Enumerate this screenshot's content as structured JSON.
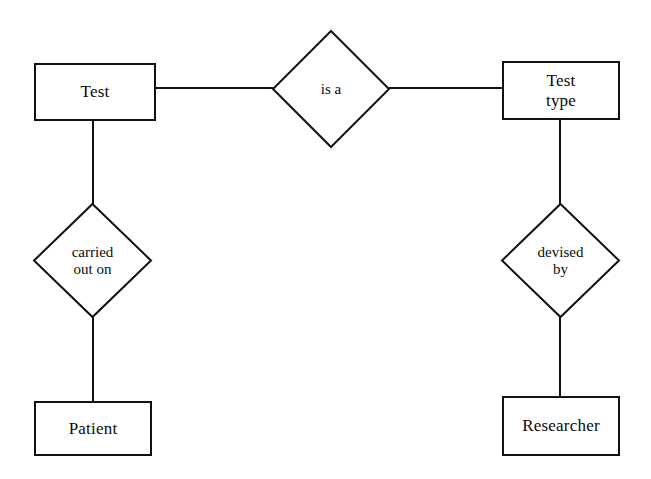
{
  "diagram": {
    "kind": "entity-relationship-diagram",
    "notation": "chen",
    "background_color": "#ffffff",
    "stroke_color": "#111111",
    "text_color": "#0b0b0b",
    "entities": [
      {
        "id": "test",
        "label": "Test"
      },
      {
        "id": "test-type",
        "label": "Test\ntype"
      },
      {
        "id": "patient",
        "label": "Patient"
      },
      {
        "id": "researcher",
        "label": "Researcher"
      }
    ],
    "relationships": [
      {
        "id": "is-a",
        "label": "is a"
      },
      {
        "id": "carried-out-on",
        "label": "carried\nout on"
      },
      {
        "id": "devised-by",
        "label": "devised\nby"
      }
    ],
    "edges": [
      {
        "id": "test-to-isa",
        "from": "test",
        "to": "is-a",
        "orientation": "horizontal"
      },
      {
        "id": "isa-to-testtype",
        "from": "is-a",
        "to": "test-type",
        "orientation": "horizontal"
      },
      {
        "id": "test-to-carried",
        "from": "test",
        "to": "carried-out-on",
        "orientation": "vertical"
      },
      {
        "id": "carried-to-patient",
        "from": "carried-out-on",
        "to": "patient",
        "orientation": "vertical"
      },
      {
        "id": "testtype-to-devised",
        "from": "test-type",
        "to": "devised-by",
        "orientation": "vertical"
      },
      {
        "id": "devised-to-researcher",
        "from": "devised-by",
        "to": "researcher",
        "orientation": "vertical"
      }
    ]
  }
}
